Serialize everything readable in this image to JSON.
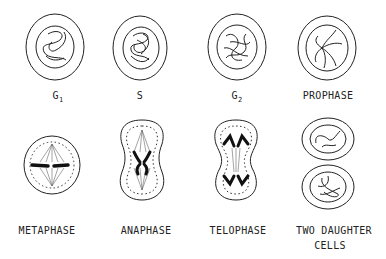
{
  "diagram": {
    "stages": [
      {
        "id": "g1",
        "label": "G",
        "sub": "1"
      },
      {
        "id": "s",
        "label": "S",
        "sub": ""
      },
      {
        "id": "g2",
        "label": "G",
        "sub": "2"
      },
      {
        "id": "prophase",
        "label": "PROPHASE",
        "sub": ""
      },
      {
        "id": "metaphase",
        "label": "METAPHASE",
        "sub": ""
      },
      {
        "id": "anaphase",
        "label": "ANAPHASE",
        "sub": ""
      },
      {
        "id": "telophase",
        "label": "TELOPHASE",
        "sub": ""
      },
      {
        "id": "daughter",
        "label": "TWO  DAUGHTER",
        "label2": "CELLS",
        "sub": ""
      }
    ]
  }
}
